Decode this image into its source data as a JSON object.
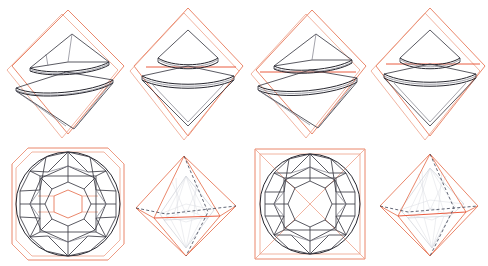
{
  "figure": {
    "background_color": "#ffffff",
    "grid": {
      "rows": 2,
      "columns": 4
    },
    "colors": {
      "rough_outline": "#e8795a",
      "rough_outline_faint": "#eda189",
      "rough_accent": "#e8492a",
      "stone_wireframe": "#3c3c46",
      "stone_wireframe_strong": "#26262e",
      "stone_wireframe_light": "#7c7c88",
      "ghost_wireframe": "#b9bcc6",
      "hidden_edge": "#3a3f52"
    },
    "panels": [
      {
        "id": "panel-1",
        "name": "side-view-asymmetric-left",
        "row": 1,
        "column": 1,
        "view": "side",
        "rough_shape": "octahedron-outline",
        "stone_alignment": "tilted",
        "description": "Side profile of brilliant cut tilted inside rough octahedron outline"
      },
      {
        "id": "panel-2",
        "name": "side-view-symmetric-left",
        "row": 1,
        "column": 2,
        "view": "side",
        "rough_shape": "octahedron-outline",
        "stone_alignment": "upright",
        "description": "Side profile of brilliant cut upright inside rough octahedron outline"
      },
      {
        "id": "panel-3",
        "name": "side-view-asymmetric-right",
        "row": 1,
        "column": 3,
        "view": "side",
        "rough_shape": "octahedron-outline",
        "stone_alignment": "tilted",
        "description": "Side profile of brilliant cut tilted inside rough octahedron outline"
      },
      {
        "id": "panel-4",
        "name": "side-view-symmetric-right",
        "row": 1,
        "column": 4,
        "view": "side",
        "rough_shape": "octahedron-outline",
        "stone_alignment": "upright",
        "description": "Side profile of brilliant cut upright inside rough octahedron outline"
      },
      {
        "id": "panel-5",
        "name": "top-view-octagonal-rough",
        "row": 2,
        "column": 1,
        "view": "top",
        "rough_shape": "octagon-outline",
        "facet_pattern": "round-brilliant-58-facet",
        "description": "Top view of round brilliant facet pattern inside octagonal rough outline"
      },
      {
        "id": "panel-6",
        "name": "perspective-octahedron-left",
        "row": 2,
        "column": 2,
        "view": "perspective",
        "rough_shape": "octahedron-wireframe",
        "description": "Perspective wireframe of rough octahedron with ghosted cut stone inside"
      },
      {
        "id": "panel-7",
        "name": "top-view-square-rough",
        "row": 2,
        "column": 3,
        "view": "top",
        "rough_shape": "square-outline-with-diagonals",
        "facet_pattern": "round-brilliant-58-facet",
        "description": "Top view of round brilliant facet pattern inside square rough outline with diagonals"
      },
      {
        "id": "panel-8",
        "name": "perspective-octahedron-right",
        "row": 2,
        "column": 4,
        "view": "perspective",
        "rough_shape": "octahedron-wireframe",
        "description": "Perspective wireframe of rough octahedron with ghosted cut stone inside"
      }
    ]
  }
}
